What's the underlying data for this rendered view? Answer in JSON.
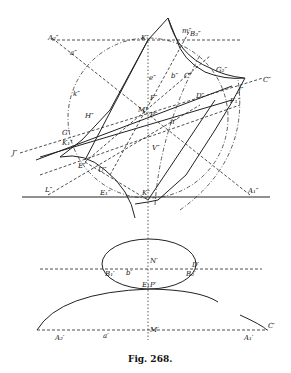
{
  "figure": {
    "caption": "Fig. 268.",
    "labels": {
      "A2pp": "A₂″",
      "app": "a″",
      "Kpp": "K″",
      "mpp": "m″",
      "B2pp": "B₂″",
      "epp": "e″",
      "bpp": "b″",
      "Cpp_small": "C″",
      "G2pp": "G₂″",
      "Cpp": "C″",
      "kpp": "k″",
      "Dpp": "D″",
      "Jpp": "J″",
      "F1pp": "F₁″",
      "Fpp": "F″",
      "Hpp": "H″",
      "Mpp": "M″",
      "Ppp": "P″",
      "npp": "n″",
      "Jcpp": "J″",
      "Gpp": "G″",
      "K1pp": "K₁″",
      "Epp": "E″",
      "Upp": "U″",
      "Vpp": "V″",
      "E1pp": "E₁″",
      "Lpp": "L″",
      "A1pp": "A₁″",
      "Np": "N′",
      "Dp": "D′",
      "B1p": "B₁′",
      "bp": "b′",
      "B2p": "B₂′",
      "E1Pp": "E₁P′",
      "A2p": "A₂′",
      "ap": "a′",
      "Mp": "M′",
      "A1p": "A₁′",
      "Cp": "C′"
    }
  }
}
